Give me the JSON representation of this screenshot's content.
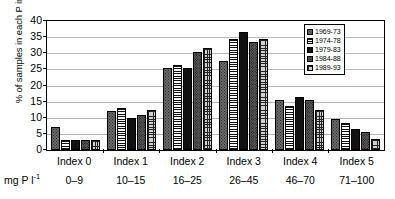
{
  "chart_data": {
    "type": "bar",
    "title": "",
    "xlabel": "",
    "ylabel": "% of samples in each P index",
    "units_caption": "mg P l",
    "units_exponent": "-1",
    "ylim": [
      0,
      40
    ],
    "yticks": [
      0,
      5,
      10,
      15,
      20,
      25,
      30,
      35,
      40
    ],
    "grid": true,
    "legend_position": "top-right",
    "categories": [
      "Index 0",
      "Index 1",
      "Index 2",
      "Index 3",
      "Index 4",
      "Index 5"
    ],
    "category_ranges": [
      "0–9",
      "10–15",
      "16–25",
      "26–45",
      "46–70",
      "71–100"
    ],
    "series": [
      {
        "name": "1969-73",
        "pattern": "dark-dotted",
        "values": [
          7.0,
          12.0,
          25.5,
          27.5,
          15.5,
          9.5
        ]
      },
      {
        "name": "1974-78",
        "pattern": "horizontal-lines",
        "values": [
          3.0,
          13.0,
          26.5,
          34.5,
          13.5,
          8.5
        ]
      },
      {
        "name": "1979-83",
        "pattern": "solid-black",
        "values": [
          3.0,
          10.0,
          25.5,
          36.5,
          16.5,
          6.5
        ]
      },
      {
        "name": "1984-88",
        "pattern": "medium-dotted",
        "values": [
          3.0,
          11.0,
          30.5,
          33.5,
          15.5,
          5.5
        ]
      },
      {
        "name": "1989-93",
        "pattern": "cross-hatch",
        "values": [
          3.0,
          12.5,
          31.5,
          34.5,
          12.5,
          3.5
        ]
      }
    ]
  }
}
